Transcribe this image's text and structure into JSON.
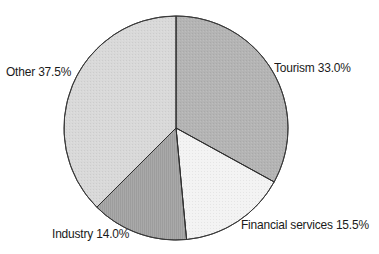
{
  "chart_data": {
    "type": "pie",
    "title": "",
    "start_angle_deg": 0,
    "direction": "clockwise",
    "categories": [
      "Tourism",
      "Financial services",
      "Industry",
      "Other"
    ],
    "values": [
      33.0,
      15.5,
      14.0,
      37.5
    ],
    "unit": "%",
    "colors": [
      "#b4b4b4",
      "#f3f3f3",
      "#a9a9a9",
      "#d9d9d9"
    ],
    "labels": [
      "Tourism 33.0%",
      "Financial services 15.5%",
      "Industry 14.0%",
      "Other 37.5%"
    ],
    "legend": "none (inline labels)"
  },
  "geometry": {
    "cx": 176,
    "cy": 128,
    "r": 112
  }
}
